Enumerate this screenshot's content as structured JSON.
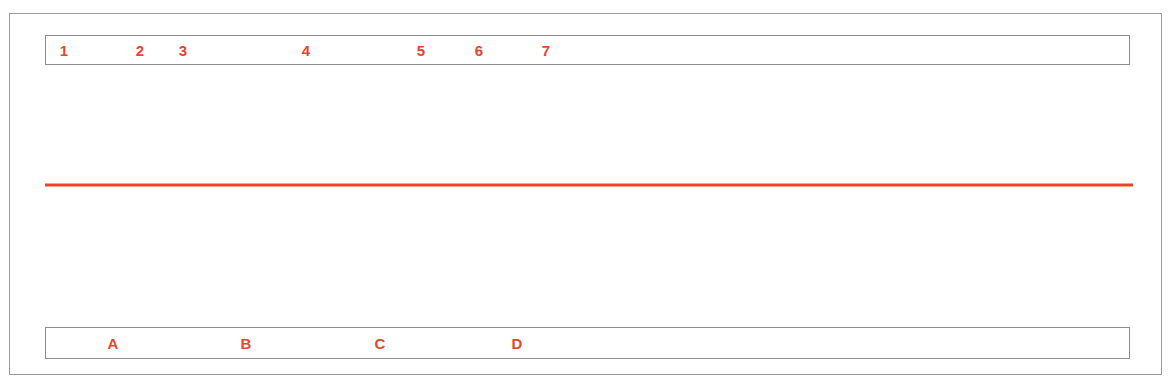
{
  "figure": {
    "type": "pacemaker-ecg-marker-channel",
    "trace_color": "#ef4423",
    "label_color": "#e8452c",
    "event_text_color": "#1a1a1a",
    "frame_color": "#9a9a9a",
    "background": "#ffffff",
    "baseline_y": 185
  },
  "top_strip": {
    "name": "numeric-interval-markers",
    "markers": [
      {
        "label": "1",
        "x": 63
      },
      {
        "label": "2",
        "x": 139
      },
      {
        "label": "3",
        "x": 182
      },
      {
        "label": "4",
        "x": 305
      },
      {
        "label": "5",
        "x": 420
      },
      {
        "label": "6",
        "x": 478
      },
      {
        "label": "7",
        "x": 545
      }
    ]
  },
  "bottom_strip": {
    "name": "letter-interval-markers",
    "markers": [
      {
        "label": "A",
        "x": 112
      },
      {
        "label": "B",
        "x": 245
      },
      {
        "label": "C",
        "x": 379
      },
      {
        "label": "D",
        "x": 516
      }
    ]
  },
  "atrial_events": {
    "name": "atrial-sense-markers",
    "baseline_y": 185,
    "events": [
      {
        "label": "AS",
        "x": 70,
        "peak_y": 160,
        "half_width": 14,
        "tall_line": false
      },
      {
        "label": "TAS",
        "x": 141,
        "peak_y": 160,
        "half_width": 14,
        "tall_line": false
      },
      {
        "label": "TAS",
        "x": 186,
        "peak_y": 160,
        "half_width": 14,
        "tall_line": false
      },
      {
        "label": "AS",
        "x": 305,
        "peak_y": 160,
        "half_width": 14,
        "tall_line": false
      },
      {
        "label": "AS",
        "x": 425,
        "peak_y": 160,
        "half_width": 14,
        "tall_line": false
      },
      {
        "label": "ASP",
        "x": 478,
        "peak_y": 160,
        "half_width": 14,
        "tall_line": true,
        "tall_line_top": 80
      },
      {
        "label": "TAS",
        "x": 549,
        "peak_y": 160,
        "half_width": 14,
        "tall_line": false
      },
      {
        "label": "TAS",
        "x": 593,
        "peak_y": 160,
        "half_width": 14,
        "tall_line": false
      },
      {
        "label": "TAS",
        "x": 635,
        "peak_y": 160,
        "half_width": 14,
        "tall_line": false
      },
      {
        "label": "TAS",
        "x": 700,
        "peak_y": 160,
        "half_width": 14,
        "tall_line": false
      },
      {
        "label": "TAS",
        "x": 731,
        "peak_y": 160,
        "half_width": 14,
        "tall_line": false
      },
      {
        "label": "TAS",
        "x": 772,
        "peak_y": 160,
        "half_width": 14,
        "tall_line": false
      },
      {
        "label": "TAS",
        "x": 839,
        "peak_y": 160,
        "half_width": 14,
        "tall_line": false
      },
      {
        "label": "TAS",
        "x": 875,
        "peak_y": 160,
        "half_width": 14,
        "tall_line": false
      },
      {
        "label": "TAS",
        "x": 907,
        "peak_y": 160,
        "half_width": 14,
        "tall_line": false
      },
      {
        "label": "TAS",
        "x": 968,
        "peak_y": 160,
        "half_width": 14,
        "tall_line": false
      },
      {
        "label": "TAS",
        "x": 1002,
        "peak_y": 160,
        "half_width": 14,
        "tall_line": false
      },
      {
        "label": "TAS",
        "x": 1037,
        "peak_y": 160,
        "half_width": 14,
        "tall_line": false
      },
      {
        "label": "TAS",
        "x": 1103,
        "peak_y": 160,
        "half_width": 14,
        "tall_line": false
      }
    ]
  },
  "ventricular_events": {
    "name": "ventricular-pace-markers",
    "baseline_y": 185,
    "events": [
      {
        "label": "VP",
        "x": 97,
        "line_bottom_y": 288,
        "v_bottom_x": 120,
        "v_bottom_y": 288,
        "v_return_x": 140
      },
      {
        "label": "VP",
        "x": 227,
        "line_bottom_y": 288,
        "v_bottom_x": 249,
        "v_bottom_y": 288,
        "v_return_x": 268
      },
      {
        "label": "VP",
        "x": 367,
        "line_bottom_y": 288,
        "v_bottom_x": 388,
        "v_bottom_y": 288,
        "v_return_x": 407
      },
      {
        "label": "VP",
        "x": 503,
        "line_bottom_y": 288,
        "v_bottom_x": 524,
        "v_bottom_y": 288,
        "v_return_x": 543
      },
      {
        "label": "VP",
        "x": 634,
        "line_bottom_y": 288,
        "v_bottom_x": 656,
        "v_bottom_y": 288,
        "v_return_x": 684
      },
      {
        "label": "VP",
        "x": 772,
        "line_bottom_y": 288,
        "v_bottom_x": 794,
        "v_bottom_y": 288,
        "v_return_x": 818
      },
      {
        "label": "VP",
        "x": 907,
        "line_bottom_y": 288,
        "v_bottom_x": 929,
        "v_bottom_y": 288,
        "v_return_x": 955
      },
      {
        "label": "VP",
        "x": 1037,
        "line_bottom_y": 288,
        "v_bottom_x": 1059,
        "v_bottom_y": 288,
        "v_return_x": 1086
      }
    ]
  },
  "baseline": {
    "name": "tracing-baseline",
    "x_start": 45,
    "x_end": 1133,
    "y": 185
  }
}
